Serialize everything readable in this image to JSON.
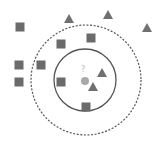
{
  "diagram": {
    "type": "knn-classification",
    "query_label": "?",
    "colors": {
      "square": "#6b6b6b",
      "triangle": "#707070",
      "query": "#a8a8a8",
      "query_label": "#b8b8b8",
      "inner_circle": "#555555",
      "outer_circle": "#555555"
    },
    "inner_circle": {
      "cx": 85,
      "cy": 80,
      "r": 31,
      "style": "solid"
    },
    "outer_circle": {
      "cx": 86,
      "cy": 80,
      "r": 55,
      "style": "dashed"
    },
    "query_point": {
      "cx": 85,
      "cy": 81,
      "r": 4
    },
    "squares": [
      {
        "x": 20,
        "y": 27
      },
      {
        "x": 91,
        "y": 38
      },
      {
        "x": 61,
        "y": 44
      },
      {
        "x": 19,
        "y": 65
      },
      {
        "x": 41,
        "y": 65
      },
      {
        "x": 19,
        "y": 82
      },
      {
        "x": 61,
        "y": 82
      },
      {
        "x": 86,
        "y": 107
      }
    ],
    "triangles": [
      {
        "x": 69,
        "y": 19
      },
      {
        "x": 108,
        "y": 15
      },
      {
        "x": 147,
        "y": 28
      },
      {
        "x": 102,
        "y": 73
      },
      {
        "x": 93,
        "y": 87
      }
    ]
  }
}
